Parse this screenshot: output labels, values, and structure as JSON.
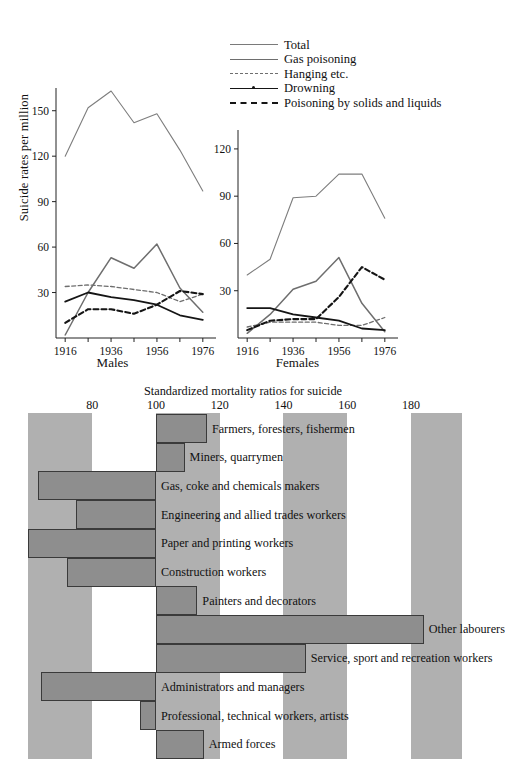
{
  "figure": {
    "top": {
      "ylabel": "Suicide rates per million",
      "legend": [
        {
          "key": "total",
          "label": "Total",
          "style": "solid-thin-grey"
        },
        {
          "key": "gas",
          "label": "Gas poisoning",
          "style": "solid-grey"
        },
        {
          "key": "hanging",
          "label": "Hanging etc.",
          "style": "dashed-grey"
        },
        {
          "key": "drowning",
          "label": "Drowning",
          "style": "solid-black-dot"
        },
        {
          "key": "poisoning",
          "label": "Poisoning by solids and liquids",
          "style": "dashed-black-bold"
        }
      ],
      "panels": [
        {
          "caption": "Males",
          "yticks": [
            "30",
            "60",
            "90",
            "120",
            "150"
          ],
          "xticks": [
            "1916",
            "1936",
            "1956",
            "1976"
          ]
        },
        {
          "caption": "Females",
          "yticks": [
            "30",
            "60",
            "90",
            "120"
          ],
          "xticks": [
            "1916",
            "1936",
            "1956",
            "1976"
          ]
        }
      ]
    },
    "bottom": {
      "title": "Standardized mortality ratios for suicide",
      "xticks": [
        "80",
        "100",
        "120",
        "140",
        "160",
        "180"
      ]
    }
  },
  "chart_data": [
    {
      "type": "line",
      "title": "Males",
      "xlabel": "Males",
      "ylabel": "Suicide rates per million",
      "x": [
        1916,
        1926,
        1936,
        1946,
        1956,
        1966,
        1976
      ],
      "xlim": [
        1912,
        1980
      ],
      "ylim": [
        0,
        165
      ],
      "yticks": [
        30,
        60,
        90,
        120,
        150
      ],
      "xticks": [
        1916,
        1936,
        1956,
        1976
      ],
      "grid": false,
      "series": [
        {
          "name": "Total",
          "values": [
            120,
            152,
            163,
            142,
            148,
            124,
            97
          ]
        },
        {
          "name": "Gas poisoning",
          "values": [
            2,
            30,
            53,
            46,
            62,
            33,
            17
          ]
        },
        {
          "name": "Hanging etc.",
          "values": [
            34,
            35,
            34,
            32,
            30,
            24,
            29
          ]
        },
        {
          "name": "Drowning",
          "values": [
            24,
            30,
            27,
            25,
            22,
            15,
            12
          ]
        },
        {
          "name": "Poisoning by solids and liquids",
          "values": [
            10,
            19,
            19,
            16,
            22,
            31,
            29
          ]
        }
      ]
    },
    {
      "type": "line",
      "title": "Females",
      "xlabel": "Females",
      "ylabel": "Suicide rates per million",
      "x": [
        1916,
        1926,
        1936,
        1946,
        1956,
        1966,
        1976
      ],
      "xlim": [
        1912,
        1980
      ],
      "ylim": [
        0,
        132
      ],
      "yticks": [
        30,
        60,
        90,
        120
      ],
      "xticks": [
        1916,
        1936,
        1956,
        1976
      ],
      "grid": false,
      "series": [
        {
          "name": "Total",
          "values": [
            40,
            50,
            89,
            90,
            104,
            104,
            76
          ]
        },
        {
          "name": "Gas poisoning",
          "values": [
            3,
            15,
            31,
            36,
            51,
            22,
            4
          ]
        },
        {
          "name": "Hanging etc.",
          "values": [
            7,
            10,
            10,
            10,
            8,
            8,
            13
          ]
        },
        {
          "name": "Drowning",
          "values": [
            19,
            19,
            15,
            13,
            11,
            6,
            5
          ]
        },
        {
          "name": "Poisoning by solids and liquids",
          "values": [
            5,
            11,
            12,
            12,
            26,
            45,
            37
          ]
        }
      ]
    },
    {
      "type": "bar",
      "orientation": "horizontal",
      "title": "Standardized mortality ratios for suicide",
      "xlabel": "Standardized mortality ratios for suicide",
      "baseline": 100,
      "xlim": [
        58,
        196
      ],
      "xticks": [
        80,
        100,
        120,
        140,
        160,
        180
      ],
      "bands": [
        [
          60,
          80
        ],
        [
          100,
          120
        ],
        [
          140,
          160
        ],
        [
          180,
          196
        ]
      ],
      "categories": [
        "Farmers, foresters, fishermen",
        "Miners, quarrymen",
        "Gas, coke and chemicals makers",
        "Engineering and allied trades workers",
        "Paper and printing workers",
        "Construction workers",
        "Painters and decorators",
        "Other labourers",
        "Service, sport and recreation workers",
        "Administrators and managers",
        "Professional, technical workers, artists",
        "Armed forces"
      ],
      "values": [
        116,
        109,
        63,
        75,
        60,
        72,
        113,
        184,
        147,
        64,
        95,
        115
      ]
    }
  ]
}
